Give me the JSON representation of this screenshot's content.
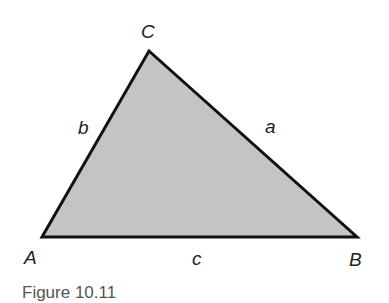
{
  "figure": {
    "triangle": {
      "fill_color": "#c4c4c4",
      "stroke_color": "#111111",
      "vertices": {
        "A": {
          "label": "A",
          "x": 42,
          "y": 237
        },
        "B": {
          "label": "B",
          "x": 357,
          "y": 237
        },
        "C": {
          "label": "C",
          "x": 149,
          "y": 51
        }
      },
      "sides": {
        "a": {
          "label": "a",
          "between": "B-C"
        },
        "b": {
          "label": "b",
          "between": "A-C"
        },
        "c": {
          "label": "c",
          "between": "A-B"
        }
      }
    },
    "caption": "Figure 10.11"
  }
}
